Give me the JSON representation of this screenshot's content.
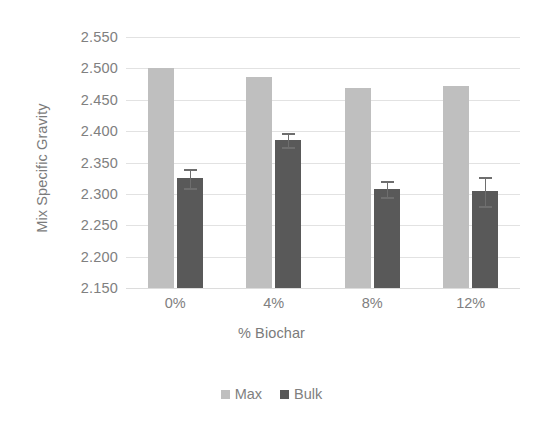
{
  "chart_data": {
    "type": "bar",
    "title": "",
    "xlabel": "% Biochar",
    "ylabel": "Mix Specific Gravity",
    "categories": [
      "0%",
      "4%",
      "8%",
      "12%"
    ],
    "ylim": [
      2.15,
      2.55
    ],
    "ytick_step": 0.05,
    "ytick_labels": [
      "2.550",
      "2.500",
      "2.450",
      "2.400",
      "2.350",
      "2.300",
      "2.250",
      "2.200",
      "2.150"
    ],
    "ytick_values": [
      2.55,
      2.5,
      2.45,
      2.4,
      2.35,
      2.3,
      2.25,
      2.2,
      2.15
    ],
    "grid": true,
    "legend_position": "bottom",
    "series": [
      {
        "name": "Max",
        "color": "#bfbfbf",
        "values": [
          2.5,
          2.486,
          2.469,
          2.472
        ],
        "errors": [
          0,
          0,
          0,
          0
        ]
      },
      {
        "name": "Bulk",
        "color": "#595959",
        "values": [
          2.325,
          2.386,
          2.308,
          2.304
        ],
        "errors": [
          0.015,
          0.011,
          0.013,
          0.023
        ]
      }
    ]
  },
  "axes": {
    "y_title": "Mix Specific Gravity",
    "x_title": "% Biochar"
  },
  "legend": {
    "items": [
      {
        "label": "Max",
        "color": "#bfbfbf"
      },
      {
        "label": "Bulk",
        "color": "#595959"
      }
    ]
  },
  "colors": {
    "max_bar": "#bfbfbf",
    "bulk_bar": "#595959",
    "gridline": "#e2e2e2",
    "text": "#808080",
    "background": "#ffffff"
  }
}
